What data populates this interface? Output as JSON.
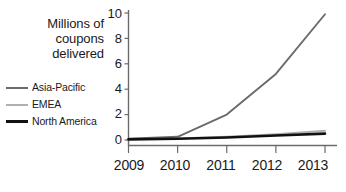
{
  "chart_data": {
    "type": "line",
    "title": "Millions of coupons delivered",
    "title_lines": [
      "Millions of",
      "coupons",
      "delivered"
    ],
    "xlabel": "",
    "ylabel": "Millions of coupons delivered",
    "categories": [
      "2009",
      "2010",
      "2011",
      "2012",
      "2013"
    ],
    "x": [
      2009,
      2010,
      2011,
      2012,
      2013
    ],
    "ylim": [
      0,
      10
    ],
    "xlim": [
      2009,
      2013
    ],
    "yticks": [
      0,
      2,
      4,
      6,
      8,
      10
    ],
    "ytick_labels": [
      "0",
      "2",
      "4",
      "6",
      "8",
      "10"
    ],
    "xtick_labels": [
      "2009",
      "2010",
      "2011",
      "2012",
      "2013"
    ],
    "grid": false,
    "legend_position": "left",
    "series": [
      {
        "name": "Asia-Pacific",
        "color": "#6b6b6b",
        "values": [
          0.1,
          0.25,
          2.0,
          5.2,
          9.9
        ]
      },
      {
        "name": "EMEA",
        "color": "#b0b0b0",
        "values": [
          0.05,
          0.12,
          0.25,
          0.45,
          0.72
        ]
      },
      {
        "name": "North America",
        "color": "#111111",
        "values": [
          0.05,
          0.1,
          0.2,
          0.35,
          0.5
        ]
      }
    ]
  },
  "axis": {
    "line_color": "#6b6b6b",
    "tick_color": "#6b6b6b"
  },
  "footer": {
    "source_note": ""
  }
}
